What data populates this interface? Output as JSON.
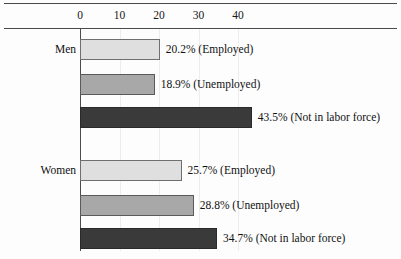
{
  "chart_data": {
    "type": "bar",
    "orientation": "horizontal",
    "title": "",
    "xlabel": "",
    "ylabel": "",
    "xlim": [
      0,
      50
    ],
    "axis_ticks": [
      0,
      10,
      20,
      30,
      40
    ],
    "axis_tick_labels": [
      "0",
      "10",
      "20",
      "30",
      "40"
    ],
    "grid": true,
    "legend": "none",
    "categories": [
      "Men",
      "Women"
    ],
    "series": [
      {
        "name": "Employed",
        "values": [
          20.2,
          25.7
        ]
      },
      {
        "name": "Unemployed",
        "values": [
          18.9,
          28.8
        ]
      },
      {
        "name": "Not in labor force",
        "values": [
          43.5,
          34.7
        ]
      }
    ],
    "bars": [
      {
        "group": "Men",
        "series": "Employed",
        "value": 20.2,
        "label": "20.2% (Employed)",
        "style": "light"
      },
      {
        "group": "Men",
        "series": "Unemployed",
        "value": 18.9,
        "label": "18.9% (Unemployed)",
        "style": "medium"
      },
      {
        "group": "Men",
        "series": "Not in labor force",
        "value": 43.5,
        "label": "43.5% (Not in labor force)",
        "style": "dark"
      },
      {
        "group": "Women",
        "series": "Employed",
        "value": 25.7,
        "label": "25.7% (Employed)",
        "style": "light"
      },
      {
        "group": "Women",
        "series": "Unemployed",
        "value": 28.8,
        "label": "28.8% (Unemployed)",
        "style": "medium"
      },
      {
        "group": "Women",
        "series": "Not in labor force",
        "value": 34.7,
        "label": "34.7% (Not in labor force)",
        "style": "dark"
      }
    ],
    "colors": {
      "light": "#dfdfdf",
      "medium": "#a8a8a8",
      "dark": "#3a3a3a",
      "axis": "#4a4a4a",
      "gridline": "#ededed",
      "text": "#111111",
      "background": "#fdfdfd"
    }
  },
  "group_labels": [
    {
      "text": "Men",
      "value": "Men"
    },
    {
      "text": "Women",
      "value": "Women"
    }
  ]
}
